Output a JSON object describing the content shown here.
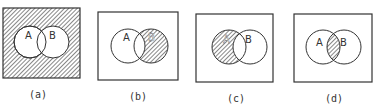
{
  "figure": {
    "panels": [
      {
        "id": "a",
        "caption": "(a)",
        "circle_a_label": "A",
        "circle_b_label": "B",
        "shaded_region": "complement of A union B"
      },
      {
        "id": "b",
        "caption": "(b)",
        "circle_a_label": "A",
        "circle_b_label": "B",
        "shaded_region": "B minus A"
      },
      {
        "id": "c",
        "caption": "(c)",
        "circle_a_label": "A",
        "circle_b_label": "B",
        "shaded_region": "A minus B"
      },
      {
        "id": "d",
        "caption": "(d)",
        "circle_a_label": "A",
        "circle_b_label": "B",
        "shaded_region": "A intersect B"
      }
    ],
    "colors": {
      "stroke": "#333333",
      "hatch": "#555555",
      "background": "#ffffff"
    }
  }
}
